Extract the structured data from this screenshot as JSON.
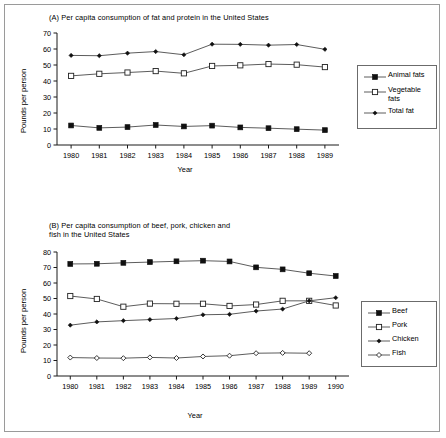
{
  "figure": {
    "background": "#ffffff",
    "border_color": "#9a9a9a",
    "axis_color": "#1a1a1a",
    "line_color": "#4a4a4a",
    "marker_fill": "#101010",
    "marker_open_fill": "#ffffff"
  },
  "chart_data": [
    {
      "id": "panel-a",
      "type": "line",
      "title": "(A) Per capita consumption of fat and protein in the United States",
      "xlabel": "Year",
      "ylabel": "Pounds per person",
      "categories": [
        "1980",
        "1981",
        "1982",
        "1983",
        "1984",
        "1985",
        "1986",
        "1987",
        "1988",
        "1989"
      ],
      "x": [
        1980,
        1981,
        1982,
        1983,
        1984,
        1985,
        1986,
        1987,
        1988,
        1989
      ],
      "xlim": [
        1979.5,
        1989.5
      ],
      "ylim": [
        0,
        70
      ],
      "yticks": [
        0,
        10,
        20,
        30,
        40,
        50,
        60,
        70
      ],
      "ytick_labels": [
        "0",
        "10",
        "20",
        "30",
        "40",
        "50",
        "60",
        "70"
      ],
      "grid": false,
      "legend_position": "right",
      "series": [
        {
          "name": "Animal fats",
          "marker": "filled-square",
          "values": [
            12.2,
            10.7,
            11.2,
            12.5,
            11.6,
            12.1,
            11.0,
            10.5,
            9.9,
            9.3
          ]
        },
        {
          "name": "Vegetable fats",
          "marker": "open-square",
          "values": [
            43.2,
            44.5,
            45.3,
            46.2,
            44.8,
            49.4,
            49.8,
            50.6,
            50.2,
            48.7
          ]
        },
        {
          "name": "Total fat",
          "marker": "filled-diamond",
          "values": [
            56.0,
            55.8,
            57.4,
            58.4,
            56.4,
            63.0,
            62.9,
            62.4,
            62.8,
            59.8
          ]
        }
      ]
    },
    {
      "id": "panel-b",
      "type": "line",
      "title": "(B) Per capita consumption of beef, pork, chicken and\nfish in the United States",
      "xlabel": "Year",
      "ylabel": "Pounds per person",
      "categories": [
        "1980",
        "1981",
        "1982",
        "1983",
        "1984",
        "1985",
        "1986",
        "1987",
        "1988",
        "1989",
        "1990"
      ],
      "x": [
        1980,
        1981,
        1982,
        1983,
        1984,
        1985,
        1986,
        1987,
        1988,
        1989,
        1990
      ],
      "xlim": [
        1979.5,
        1990.5
      ],
      "ylim": [
        0,
        80
      ],
      "yticks": [
        0,
        10,
        20,
        30,
        40,
        50,
        60,
        70,
        80
      ],
      "ytick_labels": [
        "0",
        "10",
        "20",
        "30",
        "40",
        "50",
        "60",
        "70",
        "80"
      ],
      "grid": false,
      "legend_position": "right",
      "series": [
        {
          "name": "Beef",
          "marker": "filled-square",
          "values": [
            72.3,
            72.4,
            73.0,
            73.5,
            74.0,
            74.4,
            73.9,
            70.1,
            68.8,
            66.3,
            64.5
          ]
        },
        {
          "name": "Pork",
          "marker": "open-square",
          "values": [
            51.6,
            49.7,
            44.7,
            46.7,
            46.6,
            46.6,
            45.2,
            46.1,
            48.5,
            48.5,
            45.5
          ]
        },
        {
          "name": "Chicken",
          "marker": "filled-diamond",
          "values": [
            32.8,
            34.9,
            35.7,
            36.4,
            37.1,
            39.5,
            39.8,
            41.9,
            43.2,
            48.5,
            50.5
          ]
        },
        {
          "name": "Fish",
          "marker": "open-diamond",
          "values": [
            11.9,
            11.6,
            11.5,
            12.0,
            11.6,
            12.6,
            13.1,
            14.7,
            14.9,
            14.7,
            null
          ]
        }
      ]
    }
  ]
}
